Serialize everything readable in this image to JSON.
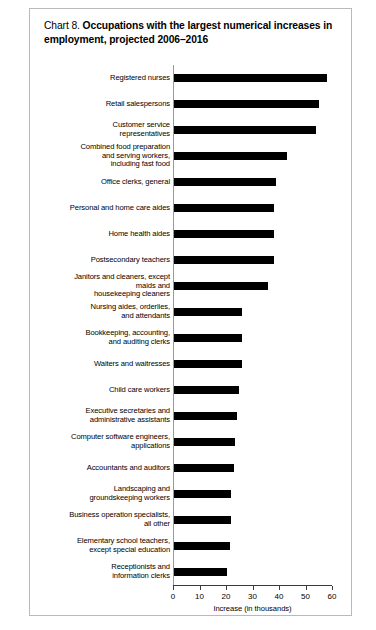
{
  "chart": {
    "title_prefix": "Chart 8.",
    "title_main": "Occupations with the largest numerical increases in employment, projected 2006–2016"
  },
  "chart_data": {
    "type": "bar",
    "orientation": "horizontal",
    "title": "Chart 8. Occupations with the largest numerical increases in employment, projected 2006–2016",
    "xlabel": "Increase (in thousands)",
    "ylabel": "",
    "xlim": [
      0,
      60
    ],
    "xticks": [
      0,
      10,
      20,
      30,
      40,
      50,
      60
    ],
    "xtick_labels": [
      "0",
      "10",
      "20",
      "30",
      "40",
      "50",
      "60"
    ],
    "grid": false,
    "legend": false,
    "bar_color": "#000000",
    "categories": [
      "Registered nurses",
      "Retail salespersons",
      "Customer service\nrepresentatives",
      "Combined food preparation\nand serving workers,\nincluding fast food",
      "Office clerks, general",
      "Personal and home care aides",
      "Home health aides",
      "Postsecondary teachers",
      "Janitors and cleaners, except\nmaids and\nhousekeeping cleaners",
      "Nursing aides, orderlies,\nand attendants",
      "Bookkeeping, accounting,\nand auditing clerks",
      "Waiters and waitresses",
      "Child care workers",
      "Executive secretaries and\nadministrative assistants",
      "Computer software engineers,\napplications",
      "Accountants and auditors",
      "Landscaping and\ngroundskeeping workers",
      "Business operation specialists,\nall other",
      "Elementary school teachers,\nexcept special education",
      "Receptionists and\ninformation clerks"
    ],
    "values": [
      58,
      55,
      54,
      43,
      39,
      38,
      38,
      38,
      36,
      26,
      26,
      26,
      25,
      24,
      23.5,
      23,
      22,
      22,
      21.5,
      20.5
    ]
  },
  "axis": {
    "x_title": "Increase (in thousands)"
  }
}
